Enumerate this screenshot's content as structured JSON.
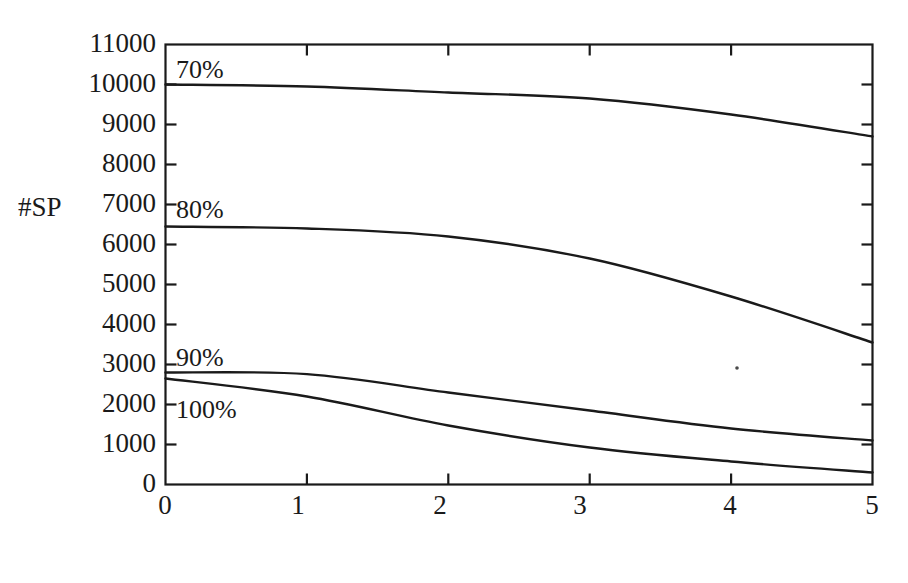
{
  "chart_data": {
    "type": "line",
    "title": "",
    "xlabel": "Level",
    "ylabel": "#SP",
    "xlim": [
      0,
      5
    ],
    "ylim": [
      0,
      11000
    ],
    "xticks": [
      "0",
      "1",
      "2",
      "3",
      "4",
      "5"
    ],
    "yticks": [
      "0",
      "1000",
      "2000",
      "3000",
      "4000",
      "5000",
      "6000",
      "7000",
      "8000",
      "9000",
      "10000",
      "11000"
    ],
    "grid": false,
    "legend_position": "inline-labels",
    "line_color": "#1a1a1a",
    "x": [
      0,
      1,
      2,
      3,
      4,
      5
    ],
    "series": [
      {
        "name": "70%",
        "label": "70%",
        "values": [
          10000,
          9950,
          9800,
          9650,
          9250,
          8700
        ]
      },
      {
        "name": "80%",
        "label": "80%",
        "values": [
          6450,
          6400,
          6200,
          5650,
          4700,
          3550
        ]
      },
      {
        "name": "90%",
        "label": "90%",
        "values": [
          2800,
          2760,
          2300,
          1850,
          1400,
          1100
        ]
      },
      {
        "name": "100%",
        "label": "100%",
        "values": [
          2650,
          2200,
          1475,
          925,
          575,
          300
        ]
      }
    ],
    "annotations": [
      {
        "text": "70%",
        "x": 0.1,
        "y": 10550
      },
      {
        "text": "80%",
        "x": 0.1,
        "y": 7000
      },
      {
        "text": "90%",
        "x": 0.1,
        "y": 3200
      },
      {
        "text": "100%",
        "x": 0.15,
        "y": 2150
      }
    ]
  },
  "axes": {
    "y_axis_label": "#SP",
    "x_axis_label": "Level"
  }
}
